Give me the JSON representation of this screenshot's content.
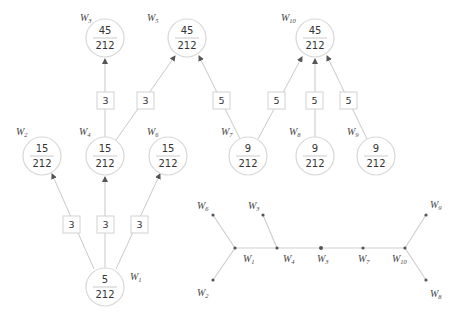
{
  "colors": {
    "edge": "#c9c9c9",
    "circle_stroke": "#d8d8d8",
    "text": "#333333",
    "dot": "#555555"
  },
  "flow_diagram": {
    "nodes": [
      {
        "id": "W3",
        "label_main": "W",
        "label_sub": "3",
        "numerator": "45",
        "denominator": "212"
      },
      {
        "id": "W5",
        "label_main": "W",
        "label_sub": "5",
        "numerator": "45",
        "denominator": "212"
      },
      {
        "id": "W10",
        "label_main": "W",
        "label_sub": "10",
        "numerator": "45",
        "denominator": "212"
      },
      {
        "id": "W2",
        "label_main": "W",
        "label_sub": "2",
        "numerator": "15",
        "denominator": "212"
      },
      {
        "id": "W4",
        "label_main": "W",
        "label_sub": "4",
        "numerator": "15",
        "denominator": "212"
      },
      {
        "id": "W6",
        "label_main": "W",
        "label_sub": "6",
        "numerator": "15",
        "denominator": "212"
      },
      {
        "id": "W7",
        "label_main": "W",
        "label_sub": "7",
        "numerator": "9",
        "denominator": "212"
      },
      {
        "id": "W8",
        "label_main": "W",
        "label_sub": "8",
        "numerator": "9",
        "denominator": "212"
      },
      {
        "id": "W9",
        "label_main": "W",
        "label_sub": "9",
        "numerator": "9",
        "denominator": "212"
      },
      {
        "id": "W1",
        "label_main": "W",
        "label_sub": "1",
        "numerator": "5",
        "denominator": "212"
      }
    ],
    "edge_weights": [
      {
        "from": "W4",
        "to": "W3",
        "weight": "3"
      },
      {
        "from": "W4",
        "to": "W5",
        "weight": "3"
      },
      {
        "from": "W7",
        "to": "W5",
        "weight": "5"
      },
      {
        "from": "W7",
        "to": "W10",
        "weight": "5"
      },
      {
        "from": "W8",
        "to": "W10",
        "weight": "5"
      },
      {
        "from": "W9",
        "to": "W10",
        "weight": "5"
      },
      {
        "from": "W1",
        "to": "W2",
        "weight": "3"
      },
      {
        "from": "W1",
        "to": "W4",
        "weight": "3"
      },
      {
        "from": "W1",
        "to": "W6",
        "weight": "3"
      }
    ]
  },
  "tree_diagram": {
    "labels": [
      {
        "id": "W6",
        "main": "W",
        "sub": "6"
      },
      {
        "id": "W3top",
        "main": "W",
        "sub": "3"
      },
      {
        "id": "W1",
        "main": "W",
        "sub": "1"
      },
      {
        "id": "W4",
        "main": "W",
        "sub": "4"
      },
      {
        "id": "W3",
        "main": "W",
        "sub": "3"
      },
      {
        "id": "W7",
        "main": "W",
        "sub": "7"
      },
      {
        "id": "W10",
        "main": "W",
        "sub": "10"
      },
      {
        "id": "W2",
        "main": "W",
        "sub": "2"
      },
      {
        "id": "W9",
        "main": "W",
        "sub": "9"
      },
      {
        "id": "W8",
        "main": "W",
        "sub": "8"
      }
    ]
  }
}
